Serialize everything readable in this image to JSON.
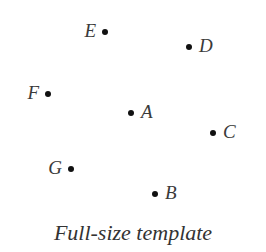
{
  "figure": {
    "caption": "Full-size template",
    "dot_color": "#111111",
    "label_color": "#3a3a3a",
    "points": [
      {
        "label": "E",
        "x": 105,
        "y": 32,
        "label_side": "left"
      },
      {
        "label": "D",
        "x": 189,
        "y": 47,
        "label_side": "right"
      },
      {
        "label": "F",
        "x": 48,
        "y": 94,
        "label_side": "left"
      },
      {
        "label": "A",
        "x": 131,
        "y": 113,
        "label_side": "right"
      },
      {
        "label": "C",
        "x": 213,
        "y": 133,
        "label_side": "right"
      },
      {
        "label": "G",
        "x": 71,
        "y": 169,
        "label_side": "left"
      },
      {
        "label": "B",
        "x": 155,
        "y": 194,
        "label_side": "right"
      }
    ]
  }
}
